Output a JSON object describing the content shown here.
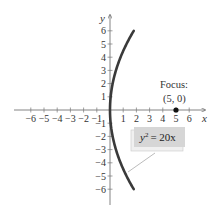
{
  "chart_data": {
    "type": "line",
    "title": "",
    "equation": "y² = 20x",
    "equation_parts": {
      "lhs_var": "y",
      "lhs_exp": "2",
      "rhs": "= 20x"
    },
    "xlabel": "x",
    "ylabel": "y",
    "xlim": [
      -7,
      7
    ],
    "ylim": [
      -7,
      7
    ],
    "x_ticks": [
      -6,
      -5,
      -4,
      -3,
      -2,
      -1,
      1,
      2,
      3,
      4,
      5,
      6
    ],
    "y_ticks": [
      6,
      5,
      4,
      3,
      2,
      1,
      -1,
      -2,
      -3,
      -4,
      -5,
      -6
    ],
    "x_tick_labels": [
      "−6",
      "−5",
      "−4",
      "−3",
      "−2",
      "−1",
      "1",
      "2",
      "3",
      "4",
      "5",
      "6"
    ],
    "y_tick_labels": [
      "6",
      "5",
      "4",
      "3",
      "2",
      "1",
      "−1",
      "−2",
      "−3",
      "−4",
      "−5",
      "−6"
    ],
    "series": [
      {
        "name": "y² = 20x",
        "x": [
          1.8,
          1.25,
          0.8,
          0.45,
          0.2,
          0.05,
          0,
          0.05,
          0.2,
          0.45,
          0.8,
          1.25,
          1.8
        ],
        "y": [
          6,
          5,
          4,
          3,
          2,
          1,
          0,
          -1,
          -2,
          -3,
          -4,
          -5,
          -6
        ]
      }
    ],
    "annotations": [
      {
        "label": "Focus:",
        "sublabel": "(5, 0)",
        "point": [
          5,
          0
        ]
      }
    ],
    "grid": false,
    "legend_position": "lower-right callout"
  },
  "labels": {
    "focus_title": "Focus:",
    "focus_coords": "(5, 0)",
    "x_axis": "x",
    "y_axis": "y"
  }
}
